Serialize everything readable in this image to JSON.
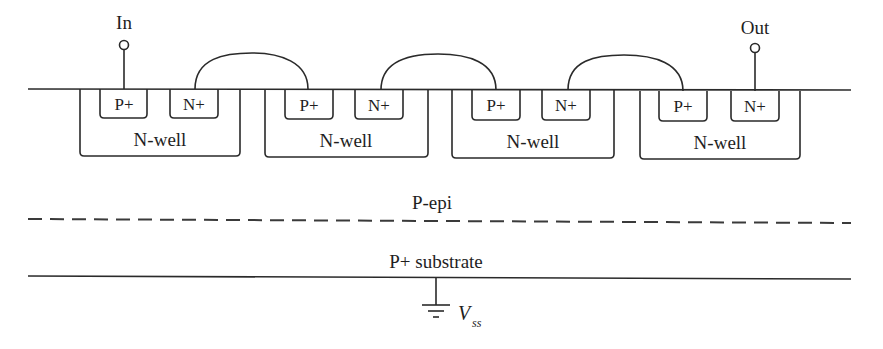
{
  "diagram": {
    "type": "cmos-cross-section",
    "terminals": {
      "input_label": "In",
      "output_label": "Out"
    },
    "wells": [
      {
        "label": "N-well",
        "p_diffusion": "P+",
        "n_diffusion": "N+"
      },
      {
        "label": "N-well",
        "p_diffusion": "P+",
        "n_diffusion": "N+"
      },
      {
        "label": "N-well",
        "p_diffusion": "P+",
        "n_diffusion": "N+"
      },
      {
        "label": "N-well",
        "p_diffusion": "P+",
        "n_diffusion": "N+"
      }
    ],
    "layers": {
      "epi_label": "P-epi",
      "substrate_label": "P+ substrate"
    },
    "ground": {
      "label_main": "V",
      "label_sub": "ss"
    },
    "connections": [
      {
        "from": "well1.N+",
        "to": "well2.P+"
      },
      {
        "from": "well2.N+",
        "to": "well3.P+"
      },
      {
        "from": "well3.N+",
        "to": "well4.P+"
      }
    ],
    "colors": {
      "line": "#2a2a2a",
      "text": "#1e1e1e",
      "background": "#ffffff"
    }
  }
}
